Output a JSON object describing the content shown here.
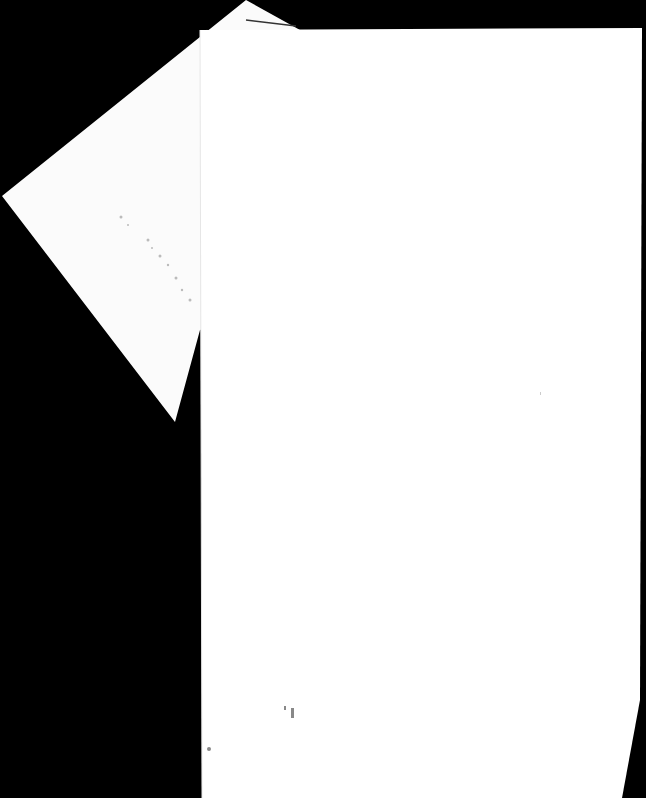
{
  "scene": {
    "description": "Photograph of two mostly blank white paper sheets on a black background",
    "background_color": "#000000",
    "paper_color": "#ffffff",
    "faint_marks": "illegible faint printed marks on rear sheet and near bottom of front sheet"
  }
}
